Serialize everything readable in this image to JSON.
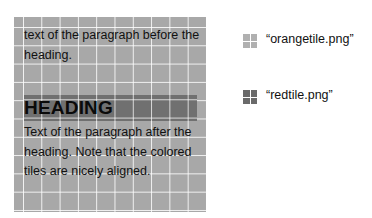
{
  "panel": {
    "paragraph_before": "text of the paragraph before the heading.",
    "heading": "HEADING",
    "paragraph_after": "Text of the paragraph after the heading. Note that the colored tiles are nicely aligned."
  },
  "legend": {
    "items": [
      {
        "label": "“orangetile.png”",
        "tile": "orange-tile",
        "color": "#b0b0b0"
      },
      {
        "label": "“redtile.png”",
        "tile": "red-tile",
        "color": "#6a6a6a"
      }
    ]
  },
  "colors": {
    "panel_background": "#a8a8a8",
    "heading_background": "#707070",
    "grid_lines": "#ffffff"
  }
}
